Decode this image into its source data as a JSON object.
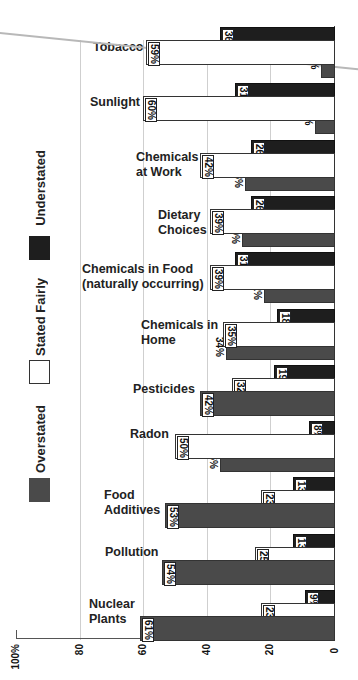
{
  "chart_data": {
    "type": "bar",
    "orientation": "horizontal",
    "title": "",
    "xlabel": "",
    "ylabel": "",
    "xlim": [
      0,
      100
    ],
    "x_ticks": [
      "0",
      "20",
      "40",
      "60",
      "80",
      "100%"
    ],
    "grid": true,
    "legend": [
      "Understated",
      "Stated Fairly",
      "Overstated"
    ],
    "legend_position": "left",
    "categories": [
      "Tobacco",
      "Sunlight",
      "Chemicals at Work",
      "Dietary Choices",
      "Chemicals in Food (naturally occurring)",
      "Chemicals in Home",
      "Pesticides",
      "Radon",
      "Food Additives",
      "Pollution",
      "Nuclear Plants"
    ],
    "series": [
      {
        "name": "Understated",
        "color": "#1e1e1e",
        "values": [
          36,
          31,
          26,
          26,
          31,
          18,
          19,
          8,
          13,
          13,
          9
        ]
      },
      {
        "name": "Stated Fairly",
        "color": "#ffffff",
        "values": [
          59,
          60,
          42,
          39,
          39,
          35,
          32,
          50,
          23,
          25,
          23
        ]
      },
      {
        "name": "Overstated",
        "color": "#4a4a4a",
        "values": [
          4,
          6,
          28,
          29,
          22,
          34,
          42,
          36,
          53,
          54,
          61
        ]
      }
    ]
  },
  "groups": [
    {
      "label": "Tobacco",
      "under": "36%",
      "fair": "59%",
      "over": "4%"
    },
    {
      "label": "Sunlight",
      "under": "31%",
      "fair": "60%",
      "over": "6%"
    },
    {
      "label": "Chemicals\nat Work",
      "under": "26%",
      "fair": "42%",
      "over": "28%"
    },
    {
      "label": "Dietary\nChoices",
      "under": "26%",
      "fair": "39%",
      "over": "29%"
    },
    {
      "label": "Chemicals in Food\n(naturally occurring)",
      "under": "31%",
      "fair": "39%",
      "over": "22%"
    },
    {
      "label": "Chemicals in\nHome",
      "under": "18%",
      "fair": "35%",
      "over": "34%"
    },
    {
      "label": "Pesticides",
      "under": "19%",
      "fair": "32%",
      "over": "42%"
    },
    {
      "label": "Radon",
      "under": "8%",
      "fair": "50%",
      "over": "36%"
    },
    {
      "label": "Food\nAdditives",
      "under": "13%",
      "fair": "23%",
      "over": "53%"
    },
    {
      "label": "Pollution",
      "under": "13%",
      "fair": "25%",
      "over": "54%"
    },
    {
      "label": "Nuclear\nPlants",
      "under": "9%",
      "fair": "23%",
      "over": "61%"
    }
  ],
  "axis": {
    "ticks": [
      "100%",
      "80",
      "60",
      "40",
      "20",
      "0"
    ]
  },
  "legend": {
    "under": "Understated",
    "fair": "Stated Fairly",
    "over": "Overstated"
  }
}
